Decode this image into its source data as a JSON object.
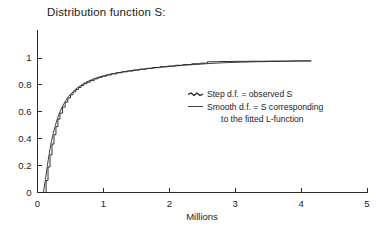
{
  "chart_data": {
    "type": "line",
    "title": "Distribution function S:",
    "xlabel": "Millions",
    "ylabel": "",
    "xlim": [
      0,
      5
    ],
    "ylim": [
      0,
      1.12
    ],
    "grid": false,
    "xticks": [
      "0",
      "1",
      "2",
      "3",
      "4",
      "5"
    ],
    "xtick_values": [
      0,
      1,
      2,
      3,
      4,
      5
    ],
    "yticks": [
      "0",
      "0.2",
      "0.4",
      "0.6",
      "0.8",
      "1"
    ],
    "ytick_values": [
      0,
      0.2,
      0.4,
      0.6,
      0.8,
      1
    ],
    "legend_position": "center-right",
    "series": [
      {
        "name": "Step d.f. = observed S",
        "style": "step",
        "color": "#1a1a1a",
        "x": [
          0.1,
          0.13,
          0.16,
          0.19,
          0.22,
          0.25,
          0.28,
          0.31,
          0.34,
          0.38,
          0.42,
          0.46,
          0.5,
          0.54,
          0.58,
          0.62,
          0.66,
          0.7,
          0.75,
          0.8,
          0.86,
          0.92,
          0.98,
          1.05,
          1.12,
          1.2,
          1.28,
          1.36,
          1.45,
          1.55,
          1.65,
          1.75,
          1.86,
          1.97,
          2.09,
          2.21,
          2.34,
          2.48,
          2.58,
          2.75,
          2.95,
          3.2,
          3.5,
          3.85,
          4.15
        ],
        "y": [
          0.0,
          0.09,
          0.19,
          0.28,
          0.36,
          0.43,
          0.49,
          0.545,
          0.59,
          0.635,
          0.672,
          0.702,
          0.727,
          0.748,
          0.765,
          0.781,
          0.795,
          0.808,
          0.82,
          0.832,
          0.845,
          0.856,
          0.865,
          0.874,
          0.882,
          0.89,
          0.897,
          0.903,
          0.91,
          0.917,
          0.923,
          0.929,
          0.935,
          0.94,
          0.946,
          0.951,
          0.957,
          0.962,
          0.972,
          0.974,
          0.975,
          0.976,
          0.977,
          0.978,
          0.979
        ]
      },
      {
        "name": "Smooth d.f. = S corresponding to the fitted L-function",
        "style": "smooth",
        "color": "#2b2b2b",
        "x": [
          0.09,
          0.12,
          0.15,
          0.18,
          0.21,
          0.24,
          0.27,
          0.3,
          0.33,
          0.37,
          0.41,
          0.45,
          0.49,
          0.53,
          0.57,
          0.61,
          0.65,
          0.7,
          0.75,
          0.8,
          0.86,
          0.92,
          0.99,
          1.06,
          1.14,
          1.22,
          1.31,
          1.4,
          1.5,
          1.61,
          1.72,
          1.84,
          1.97,
          2.1,
          2.24,
          2.39,
          2.55,
          2.72,
          2.9,
          3.1,
          3.32,
          3.55,
          3.8,
          4.0,
          4.15
        ],
        "y": [
          0.0,
          0.095,
          0.2,
          0.295,
          0.375,
          0.442,
          0.498,
          0.546,
          0.588,
          0.632,
          0.668,
          0.699,
          0.724,
          0.746,
          0.764,
          0.78,
          0.794,
          0.81,
          0.823,
          0.834,
          0.846,
          0.856,
          0.866,
          0.875,
          0.883,
          0.891,
          0.898,
          0.905,
          0.911,
          0.918,
          0.924,
          0.93,
          0.936,
          0.941,
          0.947,
          0.952,
          0.957,
          0.962,
          0.966,
          0.969,
          0.972,
          0.974,
          0.976,
          0.978,
          0.979
        ]
      }
    ],
    "legend_entries": [
      {
        "marker": "dashed",
        "label": "Step d.f. = observed S"
      },
      {
        "marker": "solid",
        "label": "Smooth d.f. = S corresponding"
      },
      {
        "marker": "none",
        "label": "to the fitted L-function"
      }
    ]
  }
}
